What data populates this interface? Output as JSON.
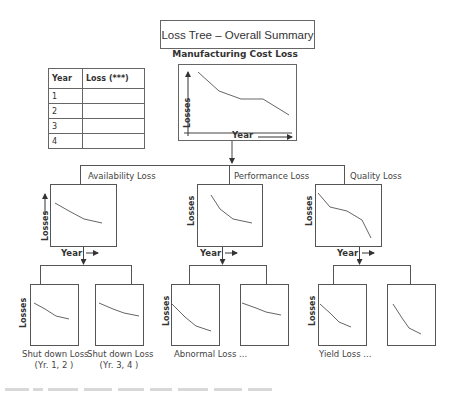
{
  "title": "Loss Tree – Overall Summary",
  "root": {
    "label": "Manufacturing Cost Loss",
    "y_axis": "Losses",
    "x_axis": "Year"
  },
  "table": {
    "headers": [
      "Year",
      "Loss (***)"
    ],
    "rows": [
      {
        "year": "1",
        "loss": ""
      },
      {
        "year": "2",
        "loss": ""
      },
      {
        "year": "3",
        "loss": ""
      },
      {
        "year": "4",
        "loss": ""
      }
    ]
  },
  "branches": [
    {
      "label": "Availability Loss",
      "y_axis": "Losses",
      "x_axis": "Year"
    },
    {
      "label": "Performance Loss",
      "y_axis": "Losses",
      "x_axis": "Year"
    },
    {
      "label": "Quality Loss",
      "y_axis": "Losses",
      "x_axis": "Year"
    }
  ],
  "children": {
    "availability": [
      {
        "label_line1": "Shut down Loss",
        "label_line2": "(Yr. 1, 2 )"
      },
      {
        "label_line1": "Shut down Loss",
        "label_line2": "(Yr. 3, 4 )"
      }
    ],
    "performance": [
      {
        "label_line1": "Abnormal Loss ..."
      },
      {
        "label_line1": ""
      }
    ],
    "quality": [
      {
        "label_line1": "Yield  Loss ..."
      },
      {
        "label_line1": ""
      }
    ]
  },
  "child_y_axis": "Losses",
  "colors": {
    "line": "#555555",
    "text": "#333333",
    "border": "#666666"
  }
}
